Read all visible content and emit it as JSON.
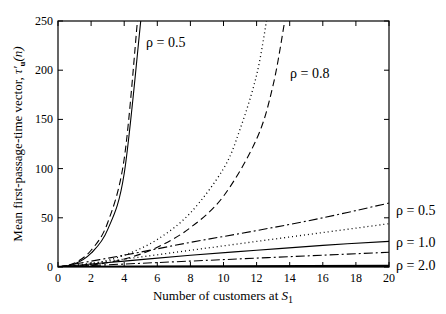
{
  "chart_data": {
    "type": "line",
    "title": "",
    "xlabel": "Number of customers at S",
    "xlabel_subscript": "1",
    "ylabel": "Mean first-passage-time vector, τ'",
    "ylabel_subscript": "u",
    "ylabel_suffix": "(n)",
    "xlim": [
      0,
      20
    ],
    "ylim": [
      0,
      250
    ],
    "xticks": [
      0,
      2,
      4,
      6,
      8,
      10,
      12,
      14,
      16,
      18,
      20
    ],
    "yticks": [
      0,
      50,
      100,
      150,
      200,
      250
    ],
    "grid": false,
    "legend": "inline labels",
    "series": [
      {
        "name": "ρ = 0.5 (solid, steep)",
        "style": "solid",
        "x": [
          0,
          1,
          2,
          3,
          4,
          5
        ],
        "values": [
          0,
          3,
          14,
          38,
          95,
          250
        ]
      },
      {
        "name": "ρ = 0.5 (dashed, steep)",
        "style": "dashed",
        "x": [
          0,
          1,
          2,
          3,
          4,
          4.8
        ],
        "values": [
          0,
          4,
          17,
          45,
          110,
          250
        ]
      },
      {
        "name": "ρ = 0.8 (dotted)",
        "style": "dotted",
        "x": [
          0,
          2,
          4,
          6,
          8,
          10,
          11,
          12,
          12.6
        ],
        "values": [
          0,
          3,
          12,
          28,
          55,
          100,
          140,
          195,
          250
        ]
      },
      {
        "name": "ρ = 0.8 (dashed)",
        "style": "dashed",
        "x": [
          0,
          2,
          4,
          6,
          8,
          10,
          12,
          13,
          13.7
        ],
        "values": [
          0,
          2,
          8,
          20,
          40,
          72,
          130,
          185,
          250
        ]
      },
      {
        "name": "ρ = 0.5 (dash-dot, slow)",
        "style": "dashdot",
        "x": [
          0,
          4,
          8,
          12,
          16,
          20
        ],
        "values": [
          0,
          12,
          25,
          37,
          50,
          65
        ]
      },
      {
        "name": "ρ = 0.5 (dotted, slow)",
        "style": "dotted",
        "x": [
          0,
          4,
          8,
          12,
          16,
          20
        ],
        "values": [
          0,
          8,
          17,
          26,
          35,
          44
        ]
      },
      {
        "name": "ρ = 1.0 (solid)",
        "style": "solid",
        "x": [
          0,
          4,
          8,
          12,
          16,
          20
        ],
        "values": [
          0,
          6,
          12,
          17,
          22,
          26
        ]
      },
      {
        "name": "ρ = 1.0 (dash-dot)",
        "style": "dashdot",
        "x": [
          0,
          4,
          8,
          12,
          16,
          20
        ],
        "values": [
          0,
          3,
          6,
          9,
          12,
          15
        ]
      },
      {
        "name": "ρ = 2.0 (thick solid)",
        "style": "solid-thick",
        "x": [
          0,
          20
        ],
        "values": [
          0,
          1
        ]
      }
    ],
    "annotations": [
      {
        "text": "ρ = 0.5",
        "pos": "upper-left near steep curves"
      },
      {
        "text": "ρ = 0.8",
        "pos": "upper-middle"
      },
      {
        "text": "ρ = 0.5",
        "pos": "right, y≈65"
      },
      {
        "text": "ρ = 1.0",
        "pos": "right, y≈26"
      },
      {
        "text": "ρ = 2.0",
        "pos": "right, y≈0"
      }
    ]
  },
  "labels": {
    "rho05_top": "ρ = 0.5",
    "rho08": "ρ = 0.8",
    "rho05_right": "ρ = 0.5",
    "rho10": "ρ = 1.0",
    "rho20": "ρ = 2.0",
    "xlabel_main": "Number of customers at ",
    "xlabel_var": "S",
    "xlabel_sub": "1",
    "ylabel_main": "Mean first-passage-time vector, ",
    "ylabel_tau": "τ'",
    "ylabel_sub": "u",
    "ylabel_suffix": "(n)"
  }
}
